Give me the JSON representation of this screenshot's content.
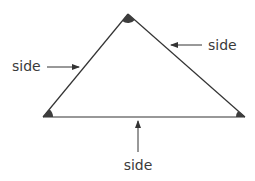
{
  "diagram": {
    "shape": "triangle",
    "vertices": {
      "apex": {
        "x": 128,
        "y": 14
      },
      "bottom_left": {
        "x": 43,
        "y": 117
      },
      "bottom_right": {
        "x": 245,
        "y": 117
      }
    },
    "labels": {
      "left_side": "side",
      "right_side": "side",
      "bottom_side": "side"
    },
    "colors": {
      "stroke": "#333333",
      "angle_fill": "#3d3d3d",
      "text": "#3a3a3a",
      "background": "#ffffff"
    }
  }
}
